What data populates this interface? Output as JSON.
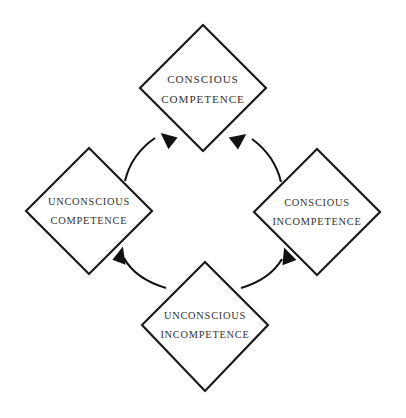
{
  "diagram": {
    "background_color": "#ffffff",
    "stroke_color": "#1a1a1a",
    "text_color": "#333330",
    "nodes": [
      {
        "id": "conscious-competence",
        "position": "top",
        "line1": "CONSCIOUS",
        "line2": "COMPETENCE",
        "center_x": 203,
        "center_y": 88
      },
      {
        "id": "unconscious-competence",
        "position": "left",
        "line1": "UNCONSCIOUS",
        "line2": "COMPETENCE",
        "center_x": 89,
        "center_y": 211
      },
      {
        "id": "conscious-incompetence",
        "position": "right",
        "line1": "CONSCIOUS",
        "line2": "INCOMPETENCE",
        "center_x": 317,
        "center_y": 212
      },
      {
        "id": "unconscious-incompetence",
        "position": "bottom",
        "line1": "UNCONSCIOUS",
        "line2": "INCOMPETENCE",
        "center_x": 205,
        "center_y": 325
      }
    ],
    "arrows": [
      {
        "id": "arrow-unconscious-incompetence-to-unconscious-competence",
        "from": "unconscious-incompetence",
        "to": "unconscious-competence",
        "direction": "up-left"
      },
      {
        "id": "arrow-unconscious-incompetence-to-conscious-incompetence",
        "from": "unconscious-incompetence",
        "to": "conscious-incompetence",
        "direction": "up-right"
      },
      {
        "id": "arrow-unconscious-competence-to-conscious-competence",
        "from": "unconscious-competence",
        "to": "conscious-competence",
        "direction": "up-right"
      },
      {
        "id": "arrow-conscious-incompetence-to-conscious-competence",
        "from": "conscious-incompetence",
        "to": "conscious-competence",
        "direction": "up-left"
      }
    ]
  }
}
